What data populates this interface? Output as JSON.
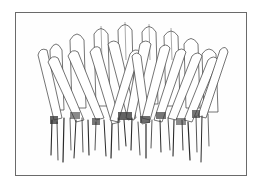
{
  "illustration": {
    "subject": "fringe of elongated leaves with rounded tips and dangling root strokes",
    "style": "pen-and-ink line drawing",
    "frame": {
      "border_color": "#6a6a6a",
      "background": "#ffffff"
    },
    "colors": {
      "ink": "#3a3a3a",
      "shadow": "#2a2a2a"
    }
  }
}
